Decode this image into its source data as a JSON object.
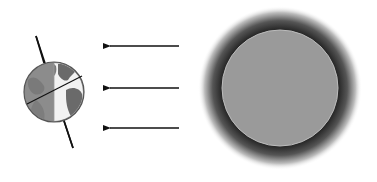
{
  "diagram": {
    "earth": {
      "label": "",
      "cx": 54,
      "cy": 92,
      "r": 30,
      "day_color": "#f4f4f4",
      "night_color": "#8a8a8a",
      "land_color": "#6e6e6e"
    },
    "sun": {
      "label": "",
      "cx": 280,
      "cy": 88,
      "r": 58,
      "fill": "#9a9a9a",
      "glow": "#2e2e2e"
    },
    "arrows": [
      {
        "x1": 179,
        "x2": 104,
        "y": 46
      },
      {
        "x1": 179,
        "x2": 104,
        "y": 88
      },
      {
        "x1": 179,
        "x2": 104,
        "y": 128
      }
    ]
  }
}
